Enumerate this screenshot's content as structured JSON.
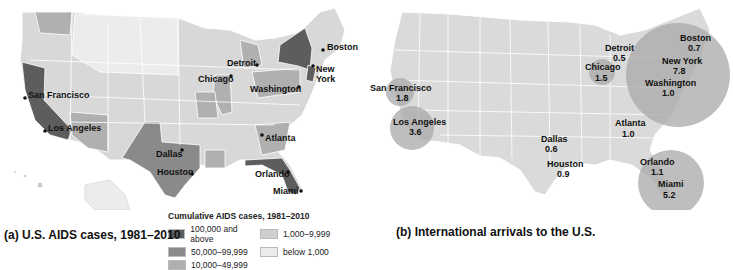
{
  "map_a": {
    "caption": "(a) U.S. AIDS cases, 1981–2010",
    "legend": {
      "title": "Cumulative AIDS cases, 1981–2010",
      "items": [
        {
          "label": "100,000 and above",
          "color": "#5d5d5d"
        },
        {
          "label": "1,000–9,999",
          "color": "#cfcfcf"
        },
        {
          "label": "50,000–99,999",
          "color": "#8a8a8a"
        },
        {
          "label": "below 1,000",
          "color": "#ececec"
        },
        {
          "label": "10,000–49,999",
          "color": "#b0b0b0"
        }
      ]
    },
    "cities": {
      "boston": "Boston",
      "new_york_1": "New",
      "new_york_2": "York",
      "detroit": "Detroit",
      "chicago": "Chicago",
      "washington": "Washington",
      "san_francisco": "San Francisco",
      "los_angeles": "Los Angeles",
      "atlanta": "Atlanta",
      "dallas": "Dallas",
      "houston": "Houston",
      "orlando": "Orlando",
      "miami": "Miami"
    }
  },
  "map_b": {
    "caption": "(b) International arrivals to the U.S.",
    "cities": [
      {
        "name": "San Francisco",
        "value": "1.8"
      },
      {
        "name": "Los Angeles",
        "value": "3.6"
      },
      {
        "name": "Dallas",
        "value": "0.6"
      },
      {
        "name": "Houston",
        "value": "0.9"
      },
      {
        "name": "Chicago",
        "value": "1.5"
      },
      {
        "name": "Detroit",
        "value": "0.5"
      },
      {
        "name": "Atlanta",
        "value": "1.0"
      },
      {
        "name": "Boston",
        "value": "0.7"
      },
      {
        "name": "New York",
        "value": "7.8"
      },
      {
        "name": "Washington",
        "value": "1.0"
      },
      {
        "name": "Orlando",
        "value": "1.1"
      },
      {
        "name": "Miami",
        "value": "5.2"
      }
    ]
  }
}
